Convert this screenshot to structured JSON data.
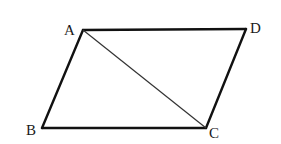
{
  "diagram": {
    "type": "parallelogram",
    "vertices": {
      "A": {
        "label": "A",
        "x": 83,
        "y": 30
      },
      "B": {
        "label": "B",
        "x": 42,
        "y": 128
      },
      "C": {
        "label": "C",
        "x": 206,
        "y": 128
      },
      "D": {
        "label": "D",
        "x": 246,
        "y": 29
      }
    },
    "edges": [
      [
        "A",
        "D"
      ],
      [
        "D",
        "C"
      ],
      [
        "C",
        "B"
      ],
      [
        "B",
        "A"
      ]
    ],
    "diagonals": [
      [
        "A",
        "C"
      ]
    ],
    "colors": {
      "line": "#111111",
      "diagonal": "#333333",
      "background": "#ffffff"
    }
  }
}
